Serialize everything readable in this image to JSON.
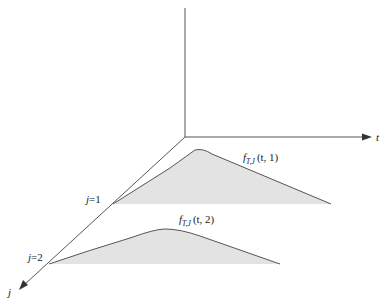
{
  "diagram": {
    "title": "",
    "axes": {
      "t_label": "t",
      "j_label": "j",
      "vertical_label": ""
    },
    "ticks": [
      {
        "label": "j=1",
        "j": 1
      },
      {
        "label": "j=2",
        "j": 2
      }
    ],
    "curves": [
      {
        "name": "f_{T,J}(t, 1)",
        "label_main": "f",
        "label_sub": "T,J",
        "label_args": "(t, 1)",
        "j": 1
      },
      {
        "name": "f_{T,J}(t, 2)",
        "label_main": "f",
        "label_sub": "T,J",
        "label_args": "(t, 2)",
        "j": 2
      }
    ],
    "colors": {
      "axis": "#555555",
      "curve": "#555555",
      "fill": "#e3e3e3",
      "text": "#222222"
    }
  }
}
